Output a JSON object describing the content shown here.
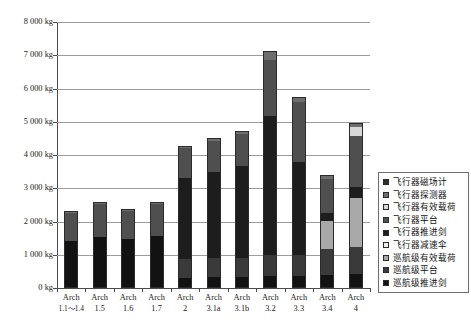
{
  "chart_data": {
    "type": "bar",
    "stacked": true,
    "title": "",
    "xlabel": "",
    "ylabel": "",
    "ylim": [
      0,
      8000
    ],
    "unit": "kg",
    "grid": true,
    "legend_position": "right",
    "ytick_labels": [
      "8 000 kg",
      "7 000 kg",
      "6 000 kg",
      "5 000 kg",
      "4 000 kg",
      "3 000 kg",
      "2 000 kg",
      "1 000 kg",
      "0 kg"
    ],
    "ytick_values": [
      8000,
      7000,
      6000,
      5000,
      4000,
      3000,
      2000,
      1000,
      0
    ],
    "categories": [
      {
        "line1": "Arch",
        "line2": "1.1～1.4"
      },
      {
        "line1": "Arch",
        "line2": "1.5"
      },
      {
        "line1": "Arch",
        "line2": "1.6"
      },
      {
        "line1": "Arch",
        "line2": "1.7"
      },
      {
        "line1": "Arch",
        "line2": "2"
      },
      {
        "line1": "Arch",
        "line2": "3.1a"
      },
      {
        "line1": "Arch",
        "line2": "3.1b"
      },
      {
        "line1": "Arch",
        "line2": "3.2"
      },
      {
        "line1": "Arch",
        "line2": "3.3"
      },
      {
        "line1": "Arch",
        "line2": "3.4"
      },
      {
        "line1": "Arch",
        "line2": "4"
      }
    ],
    "series": [
      {
        "name": "巡航级推进剑",
        "color": "#121212",
        "values": [
          1400,
          1530,
          1460,
          1560,
          310,
          330,
          330,
          360,
          370,
          400,
          420
        ]
      },
      {
        "name": "巡航级平台",
        "color": "#3a3a3a",
        "values": [
          0,
          0,
          0,
          0,
          560,
          580,
          580,
          620,
          620,
          760,
          800
        ]
      },
      {
        "name": "巡航级有效载荷",
        "color": "#a8a8a8",
        "values": [
          0,
          0,
          0,
          0,
          0,
          0,
          0,
          0,
          0,
          870,
          1500
        ]
      },
      {
        "name": "飞行器减速伞",
        "color": "#efefef",
        "values": [
          0,
          0,
          0,
          0,
          0,
          0,
          0,
          0,
          0,
          0,
          0
        ]
      },
      {
        "name": "飞行器推进剑",
        "color": "#1d1d1d",
        "values": [
          0,
          0,
          0,
          0,
          2450,
          2590,
          2770,
          4180,
          2810,
          240,
          330
        ]
      },
      {
        "name": "飞行器平台",
        "color": "#4f4f4f",
        "values": [
          850,
          990,
          850,
          970,
          900,
          930,
          960,
          1700,
          1800,
          1010,
          1530
        ]
      },
      {
        "name": "飞行器有效载荷",
        "color": "#d8d8d8",
        "values": [
          0,
          0,
          0,
          0,
          0,
          0,
          0,
          0,
          0,
          0,
          260
        ]
      },
      {
        "name": "飞行器探测器",
        "color": "#6e6e6e",
        "values": [
          60,
          70,
          60,
          70,
          60,
          70,
          80,
          230,
          120,
          95,
          100
        ]
      },
      {
        "name": "飞行器磁场计",
        "color": "#2e2e2e",
        "values": [
          0,
          0,
          0,
          0,
          0,
          0,
          0,
          30,
          30,
          25,
          25
        ]
      }
    ],
    "totals": [
      2310,
      2660,
      2370,
      2600,
      4280,
      4500,
      4720,
      7120,
      5750,
      3400,
      4965
    ],
    "legend_entries": [
      {
        "label": "飞行器磁场计",
        "color": "#2e2e2e"
      },
      {
        "label": "飞行器探测器",
        "color": "#6e6e6e"
      },
      {
        "label": "飞行器有效载荷",
        "color": "#d8d8d8"
      },
      {
        "label": "飞行器平台",
        "color": "#4f4f4f"
      },
      {
        "label": "飞行器推进剑",
        "color": "#1d1d1d"
      },
      {
        "label": "飞行器减速伞",
        "color": "#efefef"
      },
      {
        "label": "巡航级有效载荷",
        "color": "#a8a8a8"
      },
      {
        "label": "巡航级平台",
        "color": "#3a3a3a"
      },
      {
        "label": "巡航级推进剑",
        "color": "#121212"
      }
    ]
  },
  "caption": {
    "text": ""
  }
}
